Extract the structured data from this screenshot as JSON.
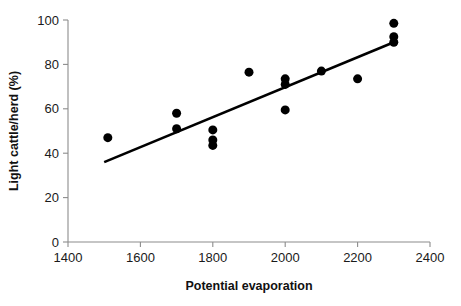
{
  "chart_data": {
    "type": "scatter",
    "title": "",
    "xlabel": "Potential evaporation",
    "ylabel": "Light cattle/herd (%)",
    "xlim": [
      1400,
      2400
    ],
    "ylim": [
      0,
      100
    ],
    "xticks": [
      1400,
      1600,
      1800,
      2000,
      2200,
      2400
    ],
    "yticks": [
      0,
      20,
      40,
      60,
      80,
      100
    ],
    "xtick_labels": [
      "1400",
      "1600",
      "1800",
      "2000",
      "2200",
      "2400"
    ],
    "ytick_labels": [
      "0",
      "20",
      "40",
      "60",
      "80",
      "100"
    ],
    "grid": false,
    "legend": false,
    "legend_position": "none",
    "marker": "filled-circle",
    "marker_color": "#000000",
    "marker_size": 9,
    "points": [
      {
        "x": 1510,
        "y": 47.0
      },
      {
        "x": 1700,
        "y": 58.0
      },
      {
        "x": 1700,
        "y": 51.0
      },
      {
        "x": 1800,
        "y": 50.5
      },
      {
        "x": 1800,
        "y": 46.0
      },
      {
        "x": 1800,
        "y": 43.5
      },
      {
        "x": 1900,
        "y": 76.5
      },
      {
        "x": 2000,
        "y": 73.5
      },
      {
        "x": 2000,
        "y": 71.0
      },
      {
        "x": 2000,
        "y": 59.5
      },
      {
        "x": 2100,
        "y": 77.0
      },
      {
        "x": 2200,
        "y": 73.5
      },
      {
        "x": 2300,
        "y": 98.5
      },
      {
        "x": 2300,
        "y": 92.5
      },
      {
        "x": 2300,
        "y": 90.0
      }
    ],
    "series": [
      {
        "name": "Light cattle/herd",
        "x": [
          1510,
          1700,
          1700,
          1800,
          1800,
          1800,
          1900,
          2000,
          2000,
          2000,
          2100,
          2200,
          2300,
          2300,
          2300
        ],
        "values": [
          47.0,
          58.0,
          51.0,
          50.5,
          46.0,
          43.5,
          76.5,
          73.5,
          71.0,
          59.5,
          77.0,
          73.5,
          98.5,
          92.5,
          90.0
        ]
      }
    ],
    "trendline": {
      "name": "linear-fit",
      "color": "#000000",
      "x_start": 1500,
      "y_start": 36.0,
      "x_end": 2300,
      "y_end": 90.0
    },
    "axis_color": "#8c8c8c",
    "background_color": "#ffffff"
  }
}
